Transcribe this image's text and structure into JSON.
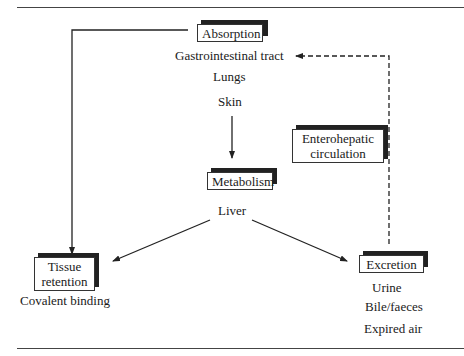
{
  "diagram": {
    "nodes": {
      "absorption": {
        "label": "Absorption",
        "items": [
          "Gastrointestinal tract",
          "Lungs",
          "Skin"
        ]
      },
      "metabolism": {
        "label": "Metabolism",
        "items": [
          "Liver"
        ]
      },
      "tissue_retention": {
        "label_line1": "Tissue",
        "label_line2": "retention",
        "items": [
          "Covalent binding"
        ]
      },
      "excretion": {
        "label": "Excretion",
        "items": [
          "Urine",
          "Bile/faeces",
          "Expired air"
        ]
      },
      "enterohepatic": {
        "label_line1": "Enterohepatic",
        "label_line2": "circulation"
      }
    },
    "edges": [
      {
        "from": "Absorption",
        "to": "Tissue retention",
        "style": "solid"
      },
      {
        "from": "Skin",
        "to": "Metabolism",
        "style": "solid"
      },
      {
        "from": "Liver",
        "to": "Tissue retention",
        "style": "solid"
      },
      {
        "from": "Liver",
        "to": "Excretion",
        "style": "solid"
      },
      {
        "from": "Excretion",
        "to": "Gastrointestinal tract",
        "style": "dashed",
        "label": "Enterohepatic circulation"
      }
    ]
  }
}
